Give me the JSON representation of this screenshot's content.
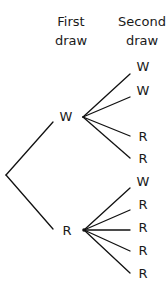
{
  "headers": {
    "first": {
      "line1": "First",
      "line2": "draw"
    },
    "second": {
      "line1": "Second",
      "line2": "draw"
    }
  },
  "tree": {
    "first_draw": [
      {
        "label": "W",
        "second_draw": [
          "W",
          "W",
          "R",
          "R"
        ]
      },
      {
        "label": "R",
        "second_draw": [
          "W",
          "R",
          "R",
          "R",
          "R"
        ]
      }
    ]
  },
  "labels": {
    "n1": "W",
    "n2": "R",
    "w1": "W",
    "w2": "W",
    "w3": "R",
    "w4": "R",
    "r1": "W",
    "r2": "R",
    "r3": "R",
    "r4": "R",
    "r5": "R"
  },
  "colors": {
    "line": "#111111",
    "text": "#1a1a1a",
    "background": "#ffffff"
  }
}
